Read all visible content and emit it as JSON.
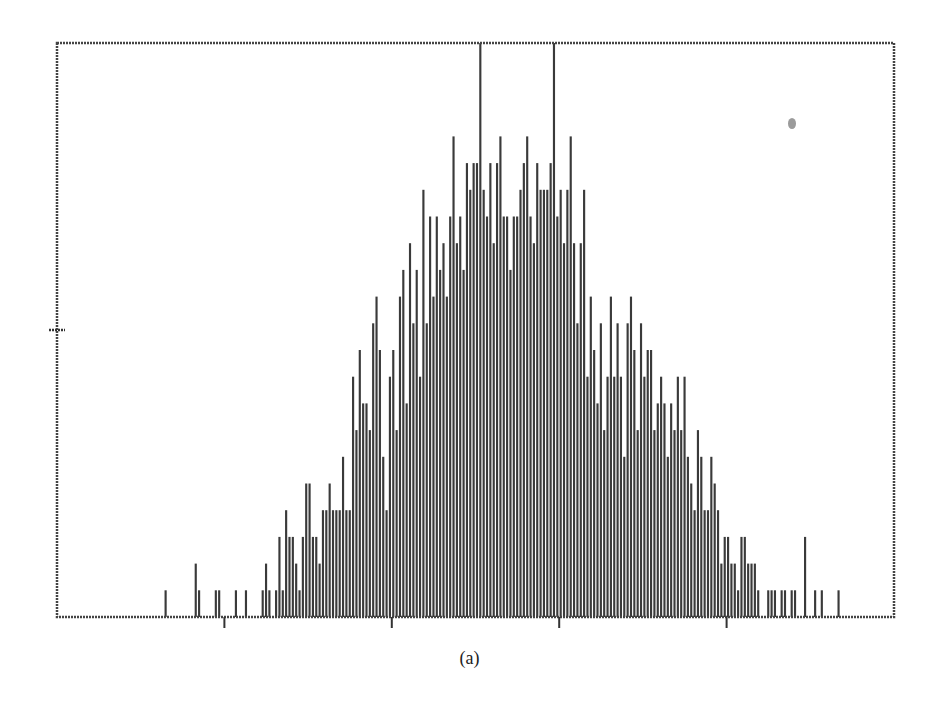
{
  "figure": {
    "caption": "(a)",
    "colors": {
      "bars": "#3a3a3a",
      "frame": "#444444",
      "background": "#ffffff",
      "smudge": "#8a8a8a"
    }
  },
  "chart_data": {
    "type": "bar",
    "title": "",
    "xlabel": "",
    "ylabel": "",
    "caption": "(a)",
    "grid": false,
    "legend": null,
    "bin_count": 250,
    "x_tick_bins": [
      50,
      100,
      150,
      200
    ],
    "x_tick_labels": [
      "",
      "",
      "",
      ""
    ],
    "y_tick_values": [
      10.75
    ],
    "y_tick_labels": [
      ""
    ],
    "ylim": [
      0,
      21.5
    ],
    "note": "Histogram with approximately Gaussian shape, centred near bin 128; counts estimated from quantized bar heights (unit ~26.7px). Two bins at the peak are clipped by the top frame.",
    "counts": [
      0,
      0,
      0,
      0,
      0,
      0,
      0,
      0,
      0,
      0,
      0,
      0,
      0,
      0,
      0,
      0,
      0,
      0,
      0,
      0,
      0,
      0,
      0,
      0,
      0,
      0,
      0,
      0,
      0,
      0,
      0,
      0,
      1,
      0,
      0,
      0,
      0,
      0,
      0,
      0,
      0,
      2,
      1,
      0,
      0,
      0,
      0,
      1,
      1,
      0,
      0,
      0,
      0,
      1,
      0,
      0,
      1,
      0,
      0,
      0,
      0,
      1,
      2,
      1,
      0,
      1,
      3,
      1,
      4,
      3,
      3,
      2,
      1,
      3,
      5,
      5,
      3,
      3,
      2,
      4,
      4,
      5,
      4,
      4,
      4,
      6,
      4,
      4,
      9,
      7,
      10,
      8,
      8,
      7,
      11,
      12,
      10,
      6,
      4,
      9,
      10,
      7,
      12,
      13,
      8,
      14,
      11,
      13,
      9,
      16,
      11,
      15,
      12,
      15,
      13,
      14,
      12,
      15,
      18,
      14,
      15,
      13,
      17,
      16,
      17,
      17,
      22,
      16,
      15,
      17,
      14,
      17,
      18,
      15,
      15,
      13,
      15,
      15,
      16,
      17,
      18,
      15,
      14,
      17,
      16,
      16,
      16,
      17,
      22,
      15,
      16,
      14,
      16,
      18,
      14,
      11,
      14,
      16,
      9,
      12,
      10,
      8,
      11,
      7,
      9,
      12,
      9,
      11,
      9,
      6,
      11,
      12,
      10,
      7,
      11,
      9,
      10,
      10,
      7,
      8,
      9,
      8,
      6,
      8,
      7,
      9,
      7,
      9,
      6,
      5,
      4,
      7,
      6,
      4,
      4,
      6,
      5,
      4,
      2,
      3,
      3,
      2,
      2,
      1,
      3,
      3,
      2,
      2,
      2,
      1,
      0,
      0,
      1,
      1,
      1,
      0,
      1,
      1,
      0,
      1,
      1,
      0,
      0,
      3,
      0,
      0,
      1,
      0,
      1,
      0,
      0,
      0,
      0,
      1,
      0,
      0,
      0,
      0,
      0,
      0,
      0,
      0,
      0,
      0,
      0,
      0,
      0,
      0,
      0,
      0
    ]
  },
  "plot": {
    "left": 57,
    "top": 43,
    "right": 894,
    "bottom": 617,
    "unit_px": 26.7
  }
}
